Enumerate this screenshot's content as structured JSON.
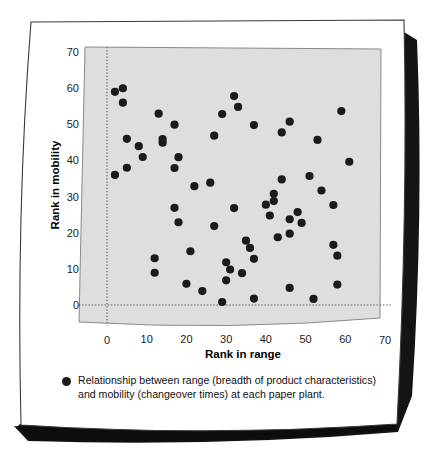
{
  "figure": {
    "background_color": "#ffffff",
    "paper_color": "#ffffff",
    "paper_border_color": "#3a3a3a",
    "shadow_color": "#141414",
    "plot_fill_color": "#dedede",
    "plot_border_color": "#8a8a8a",
    "marker_color": "#1b1b1b",
    "gridline_color": "#4a4a4a"
  },
  "caption": {
    "bullet_icon": "filled-circle-marker",
    "line1": "Relationship between range (breadth of product characteristics)",
    "line2": "and mobility (changeover times) at each paper plant."
  },
  "chart_data": {
    "type": "scatter",
    "title": "",
    "xlabel": "Rank in range",
    "ylabel": "Rank in mobility",
    "xlim": [
      0,
      70
    ],
    "ylim": [
      0,
      70
    ],
    "xticks": [
      0,
      10,
      20,
      30,
      40,
      50,
      60,
      70
    ],
    "yticks": [
      0,
      10,
      20,
      30,
      40,
      50,
      60,
      70
    ],
    "grid": false,
    "zero_reference_lines": {
      "x": 0,
      "y": 0,
      "style": "dotted"
    },
    "legend": {
      "position": "below-axes",
      "entries": [
        "Relationship between range (breadth of product characteristics) and mobility (changeover times) at each paper plant."
      ]
    },
    "series": [
      {
        "name": "paper plants",
        "marker": "circle",
        "color": "#1b1b1b",
        "points": [
          [
            2,
            59
          ],
          [
            4,
            60
          ],
          [
            4,
            56
          ],
          [
            2,
            36
          ],
          [
            5,
            38
          ],
          [
            5,
            46
          ],
          [
            8,
            44
          ],
          [
            9,
            41
          ],
          [
            12,
            13
          ],
          [
            13,
            53
          ],
          [
            14,
            46
          ],
          [
            14,
            45
          ],
          [
            12,
            9
          ],
          [
            17,
            50
          ],
          [
            17,
            38
          ],
          [
            18,
            41
          ],
          [
            17,
            27
          ],
          [
            18,
            23
          ],
          [
            20,
            6
          ],
          [
            21,
            15
          ],
          [
            22,
            33
          ],
          [
            24,
            4
          ],
          [
            26,
            34
          ],
          [
            27,
            47
          ],
          [
            27,
            22
          ],
          [
            29,
            53
          ],
          [
            29,
            1
          ],
          [
            30,
            7
          ],
          [
            30,
            12
          ],
          [
            31,
            10
          ],
          [
            32,
            58
          ],
          [
            33,
            55
          ],
          [
            32,
            27
          ],
          [
            34,
            9
          ],
          [
            35,
            18
          ],
          [
            37,
            50
          ],
          [
            36,
            16
          ],
          [
            37,
            13
          ],
          [
            37,
            2
          ],
          [
            40,
            28
          ],
          [
            41,
            25
          ],
          [
            42,
            29
          ],
          [
            42,
            31
          ],
          [
            43,
            19
          ],
          [
            44,
            48
          ],
          [
            44,
            35
          ],
          [
            46,
            51
          ],
          [
            46,
            24
          ],
          [
            46,
            20
          ],
          [
            46,
            5
          ],
          [
            48,
            26
          ],
          [
            49,
            23
          ],
          [
            51,
            36
          ],
          [
            52,
            2
          ],
          [
            53,
            46
          ],
          [
            54,
            32
          ],
          [
            57,
            17
          ],
          [
            57,
            28
          ],
          [
            58,
            14
          ],
          [
            58,
            6
          ],
          [
            59,
            54
          ],
          [
            61,
            40
          ]
        ]
      }
    ]
  }
}
